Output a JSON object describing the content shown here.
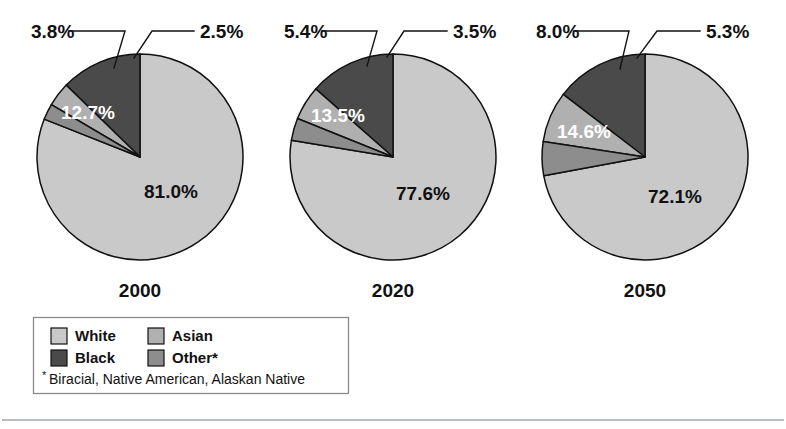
{
  "chart_data": {
    "type": "pie",
    "title": "",
    "subtitle": "",
    "xlabel": "",
    "ylabel": "",
    "grid": false,
    "legend_position": "bottom-left",
    "categories": [
      "White",
      "Black",
      "Asian",
      "Other"
    ],
    "category_colors": {
      "White": "#c9c9c9",
      "Black": "#4a4a4a",
      "Asian": "#b0b0b0",
      "Other": "#8d8d8d"
    },
    "slice_draw_order": [
      "White",
      "Other",
      "Asian",
      "Black"
    ],
    "charts": [
      {
        "name": "pie-2000",
        "year_label": "2000",
        "slices": [
          {
            "label": "White",
            "value": 81.0,
            "display": "81.0%",
            "position": "inside"
          },
          {
            "label": "Other",
            "value": 2.5,
            "display": "2.5%",
            "position": "outside"
          },
          {
            "label": "Asian",
            "value": 3.8,
            "display": "3.8%",
            "position": "outside"
          },
          {
            "label": "Black",
            "value": 12.7,
            "display": "12.7%",
            "position": "inside"
          }
        ]
      },
      {
        "name": "pie-2020",
        "year_label": "2020",
        "slices": [
          {
            "label": "White",
            "value": 77.6,
            "display": "77.6%",
            "position": "inside"
          },
          {
            "label": "Other",
            "value": 3.5,
            "display": "3.5%",
            "position": "outside"
          },
          {
            "label": "Asian",
            "value": 5.4,
            "display": "5.4%",
            "position": "outside"
          },
          {
            "label": "Black",
            "value": 13.5,
            "display": "13.5%",
            "position": "inside"
          }
        ]
      },
      {
        "name": "pie-2050",
        "year_label": "2050",
        "slices": [
          {
            "label": "White",
            "value": 72.1,
            "display": "72.1%",
            "position": "inside"
          },
          {
            "label": "Other",
            "value": 5.3,
            "display": "5.3%",
            "position": "outside"
          },
          {
            "label": "Asian",
            "value": 8.0,
            "display": "8.0%",
            "position": "outside"
          },
          {
            "label": "Black",
            "value": 14.6,
            "display": "14.6%",
            "position": "inside"
          }
        ]
      }
    ]
  },
  "legend": {
    "entries": [
      {
        "label": "White",
        "swatch": "#c9c9c9"
      },
      {
        "label": "Asian",
        "swatch": "#b0b0b0"
      },
      {
        "label": "Black",
        "swatch": "#4a4a4a"
      },
      {
        "label": "Other*",
        "swatch": "#8d8d8d"
      }
    ],
    "footnote_marker": "*",
    "footnote": "Biracial, Native American, Alaskan Native"
  },
  "years": {
    "y2000": "2000",
    "y2020": "2020",
    "y2050": "2050"
  },
  "labels": {
    "p1_white": "81.0%",
    "p1_black": "12.7%",
    "p1_asian": "3.8%",
    "p1_other": "2.5%",
    "p2_white": "77.6%",
    "p2_black": "13.5%",
    "p2_asian": "5.4%",
    "p2_other": "3.5%",
    "p3_white": "72.1%",
    "p3_black": "14.6%",
    "p3_asian": "8.0%",
    "p3_other": "5.3%"
  }
}
